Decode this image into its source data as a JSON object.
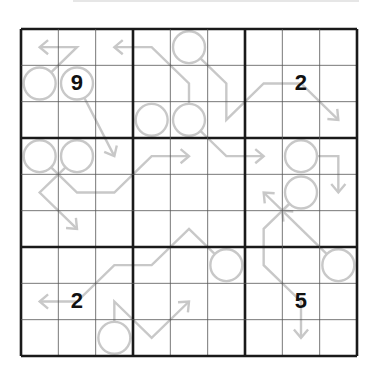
{
  "puzzle": {
    "type": "Arrow Sudoku",
    "size": 9,
    "colors": {
      "grid_thin": "#555555",
      "grid_thick": "#1a1a1a",
      "arrow": "#c8c8c8",
      "given": "#111111"
    },
    "givens": [
      {
        "row": 1,
        "col": 1,
        "value": "9"
      },
      {
        "row": 1,
        "col": 7,
        "value": "2"
      },
      {
        "row": 7,
        "col": 1,
        "value": "2"
      },
      {
        "row": 7,
        "col": 7,
        "value": "5"
      }
    ],
    "arrows": [
      {
        "circle": [
          1,
          0
        ],
        "path": [
          [
            1.5,
            0.5
          ],
          [
            0.5,
            0.5
          ]
        ]
      },
      {
        "circle": [
          1,
          1
        ],
        "path": [
          [
            2.0,
            2.5
          ],
          [
            2.5,
            3.5
          ]
        ]
      },
      {
        "circle": [
          2,
          4
        ],
        "path": [
          [
            4.5,
            1.5
          ],
          [
            3.5,
            0.5
          ],
          [
            2.5,
            0.5
          ]
        ]
      },
      {
        "circle": [
          0,
          4
        ],
        "path": [
          [
            5.5,
            1.5
          ],
          [
            5.5,
            2.5
          ],
          [
            6.5,
            1.5
          ],
          [
            7.5,
            1.5
          ],
          [
            8.5,
            2.5
          ]
        ]
      },
      {
        "circle": [
          2,
          3
        ],
        "path": []
      },
      {
        "circle": [
          2,
          4
        ],
        "path": [
          [
            5.0,
            3.0
          ],
          [
            5.5,
            3.5
          ],
          [
            6.5,
            3.5
          ]
        ]
      },
      {
        "circle": [
          3,
          0
        ],
        "path": [
          [
            1.0,
            4.0
          ],
          [
            1.5,
            4.5
          ],
          [
            2.5,
            4.5
          ],
          [
            3.0,
            4.0
          ],
          [
            3.5,
            3.5
          ],
          [
            4.5,
            3.5
          ]
        ]
      },
      {
        "circle": [
          3,
          1
        ],
        "path": [
          [
            1.0,
            4.0
          ],
          [
            0.5,
            4.5
          ],
          [
            1.5,
            5.5
          ]
        ]
      },
      {
        "circle": [
          3,
          7
        ],
        "path": [
          [
            8.5,
            3.5
          ],
          [
            8.5,
            4.5
          ]
        ]
      },
      {
        "circle": [
          4,
          7
        ],
        "path": [
          [
            7.0,
            5.0
          ],
          [
            6.5,
            4.5
          ]
        ]
      },
      {
        "circle": [
          4,
          7
        ],
        "path": [
          [
            7.0,
            5.0
          ],
          [
            6.5,
            5.5
          ],
          [
            6.5,
            6.5
          ],
          [
            7.5,
            7.5
          ],
          [
            7.5,
            8.5
          ]
        ]
      },
      {
        "circle": [
          6,
          8
        ],
        "path": [
          [
            7.0,
            5.0
          ]
        ]
      },
      {
        "circle": [
          6,
          5
        ],
        "path": [
          [
            4.5,
            5.5
          ],
          [
            3.5,
            6.5
          ],
          [
            2.5,
            6.5
          ],
          [
            1.5,
            7.5
          ],
          [
            0.5,
            7.5
          ]
        ]
      },
      {
        "circle": [
          8,
          2
        ],
        "path": [
          [
            2.5,
            7.5
          ],
          [
            3.5,
            8.5
          ],
          [
            4.5,
            7.5
          ]
        ]
      }
    ]
  }
}
